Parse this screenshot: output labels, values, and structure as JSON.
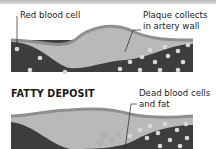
{
  "panel_top": {
    "label_left": "Red blood cell",
    "label_right_line1": "Plaque collects",
    "label_right_line2": "in artery wall"
  },
  "panel_bottom": {
    "heading": "FATTY DEPOSIT",
    "label_right_line1": "Dead blood cells",
    "label_right_line2": "and fat"
  },
  "colors": {
    "vessel_dark": "#3d3d3d",
    "plaque": "#b9b9b9",
    "wall": "#8f8f8f",
    "cell": "#d8d8d8"
  }
}
